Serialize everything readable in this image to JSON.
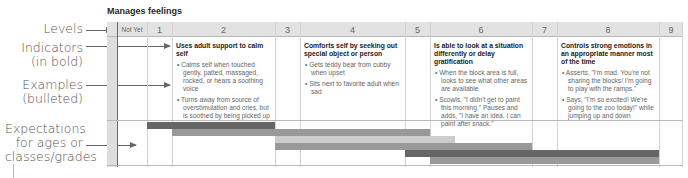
{
  "title": "Manages feelings",
  "side_labels": {
    "levels": "Levels",
    "indicators_line1": "Indicators",
    "indicators_line2": "(in bold)",
    "examples_line1": "Examples",
    "examples_line2": "(bulleted)",
    "expectations_line1": "Expectations",
    "expectations_line2": "for ages or",
    "expectations_line3": "classes/grades"
  },
  "levels": [
    "Not Yet",
    "1",
    "2",
    "3",
    "4",
    "5",
    "6",
    "7",
    "8",
    "9"
  ],
  "indicators": {
    "level2": {
      "indicator": "Uses adult support to calm self",
      "examples": [
        "Calms self when touched gently, patted, massaged, rocked, or hears a soothing voice",
        "Turns away from source of overstimulation and cries, but is soothed by being picked up"
      ]
    },
    "level4": {
      "indicator": "Comforts self by seeking out special object or person",
      "examples": [
        "Gets teddy bear from cubby when upset",
        "Sits next to favorite adult when sad"
      ]
    },
    "level6": {
      "indicator": "Is able to look at a situation differently or delay gratification",
      "examples": [
        "When the block area is full, looks to see what other areas are available",
        "Scowls, \"I didn't get to paint this morning.\" Pauses and adds, \"I have an idea. I can paint after snack.\""
      ]
    },
    "level8": {
      "indicator": "Controls strong emotions in an appropriate manner most of the time",
      "examples": [
        "Asserts, \"I'm mad. You're not sharing the blocks! I'm going to play with the ramps.\"",
        "Says, \"I'm so excited! We're going to the zoo today!\" while jumping up and down"
      ]
    }
  },
  "expectation_bars": [
    {
      "from_level": "1",
      "to_level": "2",
      "shade": "dark"
    },
    {
      "from_level": "2",
      "to_level": "5",
      "shade": "mid"
    },
    {
      "from_level": "3",
      "to_level": "5",
      "shade": "light"
    },
    {
      "from_level": "3",
      "to_level": "6",
      "shade": "mid"
    },
    {
      "from_level": "5",
      "to_level": "8",
      "shade": "dark"
    },
    {
      "from_level": "6",
      "to_level": "8",
      "shade": "mid"
    }
  ],
  "colors": {
    "dark_bar": "#666666",
    "mid_bar": "#999999",
    "light_bar": "#cccccc",
    "header": "#e2e2e2"
  }
}
